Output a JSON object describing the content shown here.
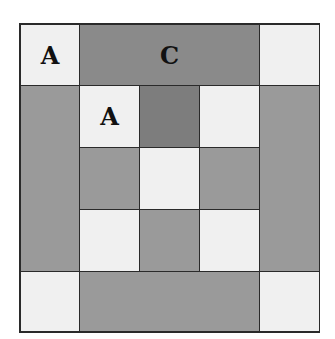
{
  "diagram": {
    "type": "quilt-block",
    "grid": {
      "cols": 5,
      "rows": 5
    },
    "colors": {
      "light": "#f0f0f0",
      "mid": "#9a9a9a",
      "dark": "#8a8a8a",
      "darker": "#7d7d7d",
      "border": "#2a2a2a"
    },
    "labels": {
      "corner_top_left": "A",
      "top_bar": "C",
      "inner_top_left": "A"
    }
  }
}
